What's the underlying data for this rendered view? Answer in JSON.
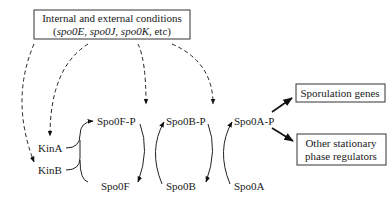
{
  "conditions_box": {
    "line1": "Internal and external conditions",
    "line2_prefix": "(",
    "gene1": "spo0E",
    "sep1": ", ",
    "gene2": "spo0J",
    "sep2": ", ",
    "gene3": "spo0K",
    "line2_suffix": ", etc)"
  },
  "nodes": {
    "kinA": "KinA",
    "kinB": "KinB",
    "spo0F_P": "Spo0F-P",
    "spo0F": "Spo0F",
    "spo0B_P": "Spo0B-P",
    "spo0B": "Spo0B",
    "spo0A_P": "Spo0A-P",
    "spo0A": "Spo0A"
  },
  "outputs": {
    "sporulation": "Sporulation genes",
    "other_line1": "Other stationary",
    "other_line2": "phase regulators"
  },
  "colors": {
    "line": "#222222",
    "text": "#1a1a1a",
    "background": "#ffffff"
  }
}
